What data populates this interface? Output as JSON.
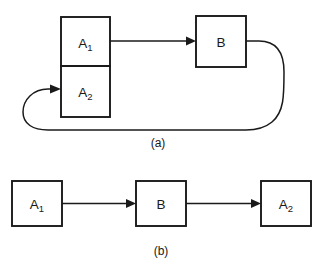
{
  "figure": {
    "background_color": "#ffffff",
    "line_color": "#1a1a1a",
    "panels": [
      {
        "id": "panel-a",
        "caption": "(a)",
        "description": "Feedback configuration: A1 feeds forward into B, and B feeds back into A2 via a loop",
        "blocks": [
          {
            "id": "a1",
            "base": "A",
            "subscript": "1",
            "x": 61,
            "y": 17,
            "width": 49,
            "height": 49
          },
          {
            "id": "a2",
            "base": "A",
            "subscript": "2",
            "x": 61,
            "y": 66,
            "width": 49,
            "height": 51
          },
          {
            "id": "b",
            "base": "B",
            "subscript": "",
            "x": 196,
            "y": 16,
            "width": 50,
            "height": 51
          }
        ],
        "connections": [
          {
            "id": "a1-to-b",
            "from": "a1",
            "to": "b",
            "kind": "straight-arrow"
          },
          {
            "id": "b-to-a2-feedback",
            "from": "b",
            "to": "a2",
            "kind": "feedback-loop"
          }
        ]
      },
      {
        "id": "panel-b",
        "caption": "(b)",
        "description": "Open-loop cascade: A1 into B into A2",
        "blocks": [
          {
            "id": "a1b",
            "base": "A",
            "subscript": "1",
            "x": 12,
            "y": 181,
            "width": 50,
            "height": 45
          },
          {
            "id": "bb",
            "base": "B",
            "subscript": "",
            "x": 136,
            "y": 181,
            "width": 50,
            "height": 45
          },
          {
            "id": "a2b",
            "base": "A",
            "subscript": "2",
            "x": 261,
            "y": 181,
            "width": 50,
            "height": 45
          }
        ],
        "connections": [
          {
            "id": "a1b-to-bb",
            "from": "a1b",
            "to": "bb",
            "kind": "straight-arrow"
          },
          {
            "id": "bb-to-a2b",
            "from": "bb",
            "to": "a2b",
            "kind": "straight-arrow"
          }
        ]
      }
    ]
  }
}
